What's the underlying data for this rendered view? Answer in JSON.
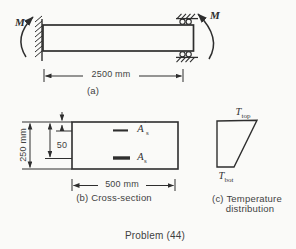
{
  "figure": {
    "part_a": {
      "label": "(a)",
      "moment_left": "M",
      "moment_right": "M",
      "span_dimension": "2500 mm"
    },
    "part_b": {
      "label": "(b) Cross-section",
      "height_dimension": "250 mm",
      "top_bar_offset": "50",
      "width_dimension": "500 mm",
      "top_steel": {
        "base": "A",
        "prime": "′",
        "sub": "s"
      },
      "bottom_steel": {
        "base": "A",
        "sub": "s"
      }
    },
    "part_c": {
      "label_line1": "(c) Temperature",
      "label_line2": "distribution",
      "temp_top": {
        "base": "T",
        "sub": "top"
      },
      "temp_bot": {
        "base": "T",
        "sub": "bot"
      }
    },
    "caption": "Problem (44)"
  },
  "colors": {
    "ink": "#2e2e2e",
    "paper": "#fafaf8"
  }
}
